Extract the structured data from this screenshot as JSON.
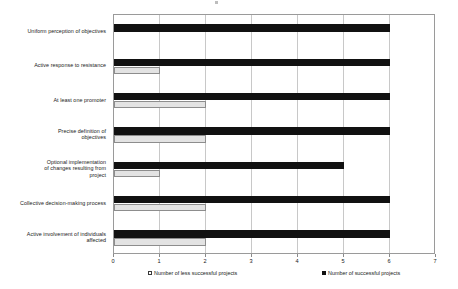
{
  "chart_data": {
    "type": "bar",
    "orientation": "horizontal",
    "title": "",
    "xlabel": "",
    "ylabel": "",
    "xlim": [
      0,
      7
    ],
    "xticks": [
      "0",
      "1",
      "2",
      "3",
      "4",
      "5",
      "6",
      "7"
    ],
    "grid": true,
    "legend_position": "bottom",
    "categories": [
      "Uniform perception of objectives",
      "Active response to resistance",
      "At least one promoter",
      "Precise definition of\nobjectives",
      "Optional implementation\nof changes resulting from\nproject",
      "Collective decision-making process",
      "Active involvement of individuals\naffected"
    ],
    "series": [
      {
        "name": "Number of successful projects",
        "color": "#111111",
        "values": [
          6,
          6,
          6,
          6,
          5,
          6,
          6
        ]
      },
      {
        "name": "Number of less successful projects",
        "color": "#e3e3e3",
        "values": [
          0,
          1,
          2,
          2,
          1,
          2,
          2
        ]
      }
    ]
  },
  "legend": {
    "items": [
      {
        "label": "Number of less successful projects",
        "swatch": "light-square-icon"
      },
      {
        "label": "Number of successful projects",
        "swatch": "dark-square-icon"
      }
    ]
  }
}
